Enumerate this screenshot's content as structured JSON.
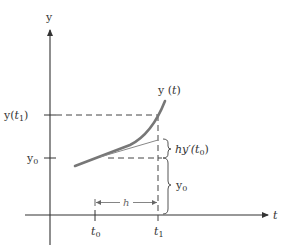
{
  "diagram": {
    "axes": {
      "y_label": "y",
      "t_label": "t"
    },
    "y_ticks": [
      {
        "label": "y(t₁)",
        "base": "y(",
        "var": "t",
        "sub": "1",
        "close": ")"
      },
      {
        "label": "y₀",
        "base": "y",
        "sub": "0"
      }
    ],
    "t_ticks": [
      {
        "label": "t₀",
        "var": "t",
        "sub": "0"
      },
      {
        "label": "t₁",
        "var": "t",
        "sub": "1"
      }
    ],
    "curve_label": {
      "base": "y (",
      "var": "t",
      "close": ")"
    },
    "annotations": {
      "increment": {
        "label": "hy′(t₀)",
        "pre": "hy′(",
        "var": "t",
        "sub": "0",
        "close": ")"
      },
      "base_height": {
        "label": "y₀",
        "base": "y",
        "sub": "0"
      },
      "step": {
        "label": "h"
      }
    },
    "colors": {
      "curve": "#777777",
      "axis": "#333333",
      "dashed": "#444444",
      "tangent": "#888888"
    }
  }
}
